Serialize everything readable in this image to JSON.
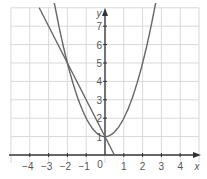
{
  "chart_data": {
    "type": "line",
    "title": "",
    "xlabel": "x",
    "ylabel": "y",
    "xlim": [
      -5,
      5
    ],
    "ylim": [
      0,
      8
    ],
    "grid": true,
    "x_ticks": [
      "-4",
      "-3",
      "-2",
      "-1",
      "0",
      "1",
      "2",
      "3",
      "4"
    ],
    "y_ticks": [
      "1",
      "2",
      "3",
      "4",
      "5",
      "6",
      "7"
    ],
    "origin_label": "0",
    "series": [
      {
        "name": "parabola",
        "equation": "y = x^2 + 1",
        "x": [
          -2.65,
          -2,
          -1,
          0,
          1,
          2,
          2.65
        ],
        "y": [
          8,
          5,
          2,
          1,
          2,
          5,
          8
        ]
      },
      {
        "name": "line",
        "equation": "y = -2x + 1",
        "x": [
          -3.5,
          -2,
          0,
          0.5
        ],
        "y": [
          8,
          5,
          1,
          0
        ]
      }
    ],
    "intersections": [
      [
        -2,
        5
      ],
      [
        0,
        1
      ]
    ],
    "colors": {
      "curve": "#666666",
      "grid": "#d9d9d9",
      "axis": "#333333",
      "text": "#555555"
    }
  }
}
